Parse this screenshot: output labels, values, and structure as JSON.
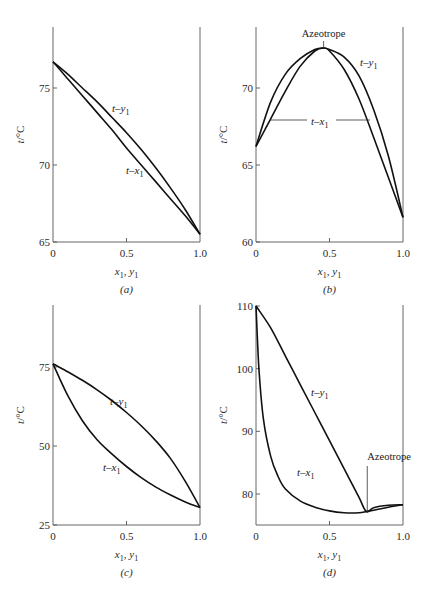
{
  "figure": {
    "panels": [
      {
        "id": "a",
        "label": "(a)",
        "ylabel": "t/°C",
        "xlabel": "x1, y1",
        "yticks": [
          "65",
          "70",
          "75"
        ],
        "xticks": [
          "0",
          "0.5",
          "1.0"
        ],
        "curve_labels": {
          "t_y1": "t-y1",
          "t_x1": "t-x1"
        }
      },
      {
        "id": "b",
        "label": "(b)",
        "ylabel": "t/°C",
        "xlabel": "x1, y1",
        "yticks": [
          "60",
          "65",
          "70"
        ],
        "xticks": [
          "0",
          "0.5",
          "1.0"
        ],
        "curve_labels": {
          "t_y1": "t-y1",
          "t_x1": "t-x1"
        },
        "annotation": "Azeotrope"
      },
      {
        "id": "c",
        "label": "(c)",
        "ylabel": "t/°C",
        "xlabel": "x1, y1",
        "yticks": [
          "25",
          "50",
          "75"
        ],
        "xticks": [
          "0",
          "0.5",
          "1.0"
        ],
        "curve_labels": {
          "t_y1": "t-y1",
          "t_x1": "t-x1"
        }
      },
      {
        "id": "d",
        "label": "(d)",
        "ylabel": "t/°C",
        "xlabel": "x1, y1",
        "yticks": [
          "80",
          "90",
          "100",
          "110"
        ],
        "xticks": [
          "0",
          "0.5",
          "1.0"
        ],
        "curve_labels": {
          "t_y1": "t-y1",
          "t_x1": "t-x1"
        },
        "annotation": "Azeotrope"
      }
    ]
  },
  "chart_data": [
    {
      "type": "line",
      "title": "(a)",
      "xlabel": "x1, y1",
      "ylabel": "t/°C",
      "xlim": [
        0,
        1
      ],
      "ylim": [
        65,
        79.5
      ],
      "grid": false,
      "series": [
        {
          "name": "t-x1",
          "x": [
            0,
            0.1,
            0.2,
            0.3,
            0.4,
            0.5,
            0.6,
            0.7,
            0.8,
            0.9,
            1.0
          ],
          "y": [
            76.7,
            75.6,
            74.5,
            73.4,
            72.3,
            71.1,
            70.0,
            68.9,
            67.8,
            66.7,
            65.5
          ]
        },
        {
          "name": "t-y1",
          "x": [
            0,
            0.1,
            0.2,
            0.3,
            0.4,
            0.5,
            0.6,
            0.7,
            0.8,
            0.9,
            1.0
          ],
          "y": [
            76.7,
            75.9,
            75.0,
            74.1,
            73.1,
            72.1,
            71.0,
            69.8,
            68.5,
            67.1,
            65.5
          ]
        }
      ]
    },
    {
      "type": "line",
      "title": "(b)",
      "xlabel": "x1, y1",
      "ylabel": "t/°C",
      "xlim": [
        0,
        1
      ],
      "ylim": [
        60,
        74.5
      ],
      "grid": false,
      "annotations": [
        {
          "text": "Azeotrope",
          "x": 0.46,
          "y": 72.6
        }
      ],
      "series": [
        {
          "name": "t-x1",
          "x": [
            0,
            0.1,
            0.2,
            0.3,
            0.4,
            0.46,
            0.5,
            0.6,
            0.7,
            0.8,
            0.9,
            1.0
          ],
          "y": [
            66.2,
            68.0,
            69.8,
            71.4,
            72.4,
            72.6,
            72.4,
            71.2,
            69.3,
            66.8,
            64.2,
            61.6
          ]
        },
        {
          "name": "t-y1",
          "x": [
            0,
            0.1,
            0.2,
            0.3,
            0.4,
            0.46,
            0.5,
            0.6,
            0.7,
            0.8,
            0.9,
            1.0
          ],
          "y": [
            66.2,
            69.1,
            70.9,
            71.9,
            72.5,
            72.6,
            72.5,
            72.0,
            70.8,
            68.6,
            65.6,
            61.6
          ]
        }
      ]
    },
    {
      "type": "line",
      "title": "(c)",
      "xlabel": "x1, y1",
      "ylabel": "t/°C",
      "xlim": [
        0,
        1
      ],
      "ylim": [
        25,
        95
      ],
      "grid": false,
      "series": [
        {
          "name": "t-x1",
          "x": [
            0,
            0.1,
            0.2,
            0.3,
            0.4,
            0.5,
            0.6,
            0.7,
            0.8,
            0.9,
            1.0
          ],
          "y": [
            76,
            66,
            58,
            52,
            47.5,
            43.5,
            40,
            37,
            34.5,
            32.3,
            30.5
          ]
        },
        {
          "name": "t-y1",
          "x": [
            0,
            0.1,
            0.2,
            0.3,
            0.4,
            0.5,
            0.6,
            0.7,
            0.8,
            0.9,
            1.0
          ],
          "y": [
            76,
            73.5,
            70.8,
            67.8,
            64.4,
            60.6,
            56.4,
            51.6,
            46,
            38.8,
            30.5
          ]
        }
      ]
    },
    {
      "type": "line",
      "title": "(d)",
      "xlabel": "x1, y1",
      "ylabel": "t/°C",
      "xlim": [
        0,
        1
      ],
      "ylim": [
        75,
        110
      ],
      "grid": false,
      "annotations": [
        {
          "text": "Azeotrope",
          "x": 0.75,
          "y": 77.2
        }
      ],
      "series": [
        {
          "name": "t-x1",
          "x": [
            0,
            0.02,
            0.05,
            0.1,
            0.15,
            0.2,
            0.3,
            0.4,
            0.5,
            0.6,
            0.7,
            0.75,
            0.8,
            0.9,
            1.0
          ],
          "y": [
            110,
            100,
            92,
            86,
            82.8,
            80.8,
            78.9,
            77.9,
            77.3,
            77.0,
            77.0,
            77.2,
            77.4,
            77.9,
            78.3
          ]
        },
        {
          "name": "t-y1",
          "x": [
            0,
            0.1,
            0.2,
            0.3,
            0.4,
            0.5,
            0.6,
            0.7,
            0.75,
            0.8,
            0.9,
            1.0
          ],
          "y": [
            110,
            106.5,
            102,
            97.5,
            93,
            88.5,
            84,
            79.5,
            77.2,
            77.8,
            78.2,
            78.3
          ]
        }
      ]
    }
  ]
}
